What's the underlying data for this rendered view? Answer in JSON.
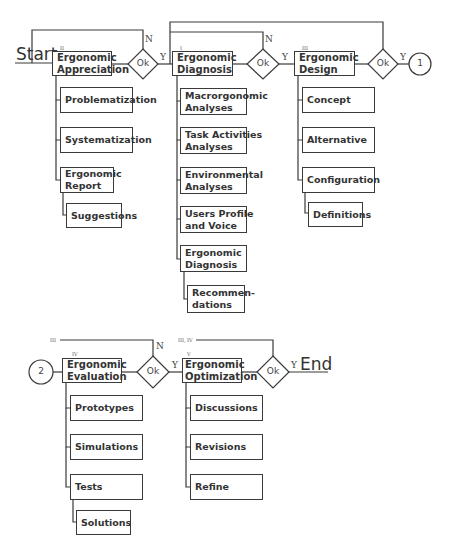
{
  "terminals": {
    "start": "Start",
    "end": "End"
  },
  "decision_label": "Ok",
  "branch_labels": {
    "yes": "Y",
    "no": "N"
  },
  "connectors": {
    "out": "1",
    "in": "2"
  },
  "loop_labels": {
    "row2_loop1": "III",
    "row2_loop2": "III, IV"
  },
  "phases": [
    {
      "roman": "II",
      "title": [
        "Ergonomic",
        "Appreciation"
      ],
      "steps": [
        "Problematization",
        "Systematization",
        "Ergonomic Report"
      ],
      "output": "Suggestions"
    },
    {
      "roman": "I",
      "title": [
        "Ergonomic",
        "Diagnosis"
      ],
      "steps": [
        "Macrorgonomic Analyses",
        "Task Activities Analyses",
        "Environmental Analyses",
        "Users Profile and Voice",
        "Ergonomic Diagnosis"
      ],
      "output": "Recommen-dations"
    },
    {
      "roman": "III",
      "title": [
        "Ergonomic",
        "Design"
      ],
      "steps": [
        "Concept",
        "Alternative",
        "Configuration"
      ],
      "output": "Definitions"
    },
    {
      "roman": "IV",
      "title": [
        "Ergonomic",
        "Evaluation"
      ],
      "steps": [
        "Prototypes",
        "Simulations",
        "Tests"
      ],
      "output": "Solutions"
    },
    {
      "roman": "V",
      "title": [
        "Ergonomic",
        "Optimization"
      ],
      "steps": [
        "Discussions",
        "Revisions",
        "Refine"
      ],
      "output": null
    }
  ],
  "text": {
    "p0_title1": "Ergonomic",
    "p0_title2": "Appreciation",
    "p0_s0": "Problematization",
    "p0_s1": "Systematization",
    "p0_s2a": "Ergonomic",
    "p0_s2b": "Report",
    "p0_out": "Suggestions",
    "p1_title1": "Ergonomic",
    "p1_title2": "Diagnosis",
    "p1_s0a": "Macrorgonomic",
    "p1_s0b": "Analyses",
    "p1_s1a": "Task Activities",
    "p1_s1b": "Analyses",
    "p1_s2a": "Environmental",
    "p1_s2b": "Analyses",
    "p1_s3a": "Users Profile",
    "p1_s3b": "and Voice",
    "p1_s4a": "Ergonomic",
    "p1_s4b": "Diagnosis",
    "p1_outa": "Recommen-",
    "p1_outb": "dations",
    "p2_title1": "Ergonomic",
    "p2_title2": "Design",
    "p2_s0": "Concept",
    "p2_s1": "Alternative",
    "p2_s2": "Configuration",
    "p2_out": "Definitions",
    "p3_title1": "Ergonomic",
    "p3_title2": "Evaluation",
    "p3_s0": "Prototypes",
    "p3_s1": "Simulations",
    "p3_s2": "Tests",
    "p3_out": "Solutions",
    "p4_title1": "Ergonomic",
    "p4_title2": "Optimization",
    "p4_s0": "Discussions",
    "p4_s1": "Revisions",
    "p4_s2": "Refine"
  },
  "colors": {
    "line": "#3a3a3a",
    "background": "#ffffff"
  }
}
